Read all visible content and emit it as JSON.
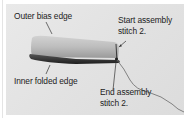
{
  "figure": {
    "labels": {
      "outer_bias_edge": "Outer bias edge",
      "start_assembly_line1": "Start assembly",
      "start_assembly_line2": "stitch 2.",
      "inner_folded_edge": "Inner folded edge",
      "end_assembly_line1": "End assembly",
      "end_assembly_line2": "stitch 2."
    },
    "colors": {
      "background": "#e4e4e4",
      "fabric_light": "#c8c8c8",
      "fabric_dark": "#2a2a2a",
      "thread": "#6a6a6a",
      "text": "#222222"
    }
  }
}
